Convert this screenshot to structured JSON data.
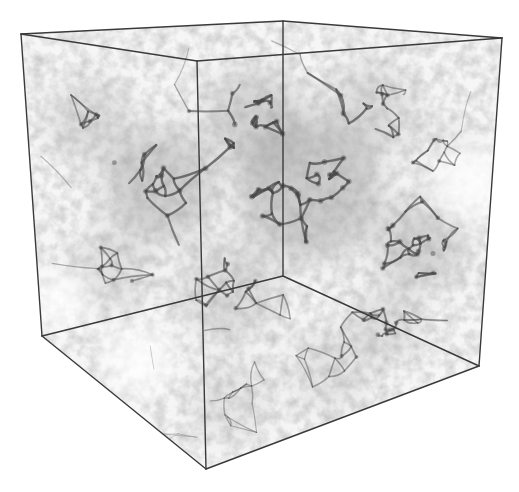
{
  "figure": {
    "kind": "cosmic-web-simulation-cube",
    "width": 519,
    "height": 492,
    "background": "#ffffff",
    "edge_color": "#3a3a3a",
    "edge_width": 1.4,
    "fill_tint": "#dcdcdc",
    "filament_color": "#4a4a4a",
    "cube": {
      "vertices": {
        "top_back_left": [
          21,
          34
        ],
        "top_back_right": [
          283,
          21
        ],
        "top_front_right": [
          502,
          38
        ],
        "top_front_left": [
          197,
          61
        ],
        "bottom_back_left": [
          42,
          336
        ],
        "bottom_back_right": [
          283,
          276
        ],
        "bottom_front_right": [
          479,
          366
        ],
        "bottom_front_left": [
          206,
          469
        ]
      },
      "edges": [
        [
          "top_back_left",
          "top_back_right"
        ],
        [
          "top_back_right",
          "top_front_right"
        ],
        [
          "top_front_right",
          "top_front_left"
        ],
        [
          "top_front_left",
          "top_back_left"
        ],
        [
          "top_back_left",
          "bottom_back_left"
        ],
        [
          "top_front_left",
          "bottom_front_left"
        ],
        [
          "top_front_right",
          "bottom_front_right"
        ],
        [
          "top_back_right",
          "bottom_back_right"
        ],
        [
          "bottom_back_left",
          "bottom_front_left"
        ],
        [
          "bottom_front_left",
          "bottom_front_right"
        ],
        [
          "bottom_back_left",
          "bottom_back_right"
        ],
        [
          "bottom_back_right",
          "bottom_front_right"
        ]
      ]
    },
    "density_clusters": [
      {
        "x": 310,
        "y": 190,
        "r": 70,
        "w": 1.0
      },
      {
        "x": 160,
        "y": 185,
        "r": 55,
        "w": 0.9
      },
      {
        "x": 255,
        "y": 120,
        "r": 50,
        "w": 0.8
      },
      {
        "x": 420,
        "y": 245,
        "r": 45,
        "w": 0.8
      },
      {
        "x": 90,
        "y": 120,
        "r": 40,
        "w": 0.6
      },
      {
        "x": 370,
        "y": 110,
        "r": 45,
        "w": 0.6
      },
      {
        "x": 385,
        "y": 325,
        "r": 35,
        "w": 0.6
      },
      {
        "x": 230,
        "y": 290,
        "r": 50,
        "w": 0.6
      },
      {
        "x": 110,
        "y": 270,
        "r": 40,
        "w": 0.5
      },
      {
        "x": 230,
        "y": 400,
        "r": 40,
        "w": 0.4
      },
      {
        "x": 330,
        "y": 370,
        "r": 40,
        "w": 0.45
      },
      {
        "x": 450,
        "y": 150,
        "r": 30,
        "w": 0.35
      }
    ],
    "seed": 7,
    "node_count": 260,
    "void_regions": [
      {
        "x": 470,
        "y": 180,
        "r": 40
      },
      {
        "x": 60,
        "y": 300,
        "r": 30
      },
      {
        "x": 140,
        "y": 360,
        "r": 35
      }
    ]
  }
}
